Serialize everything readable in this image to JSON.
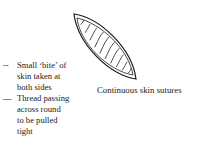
{
  "figure": {
    "caption": "Continuous skin sutures",
    "labels": [
      {
        "marker": "--",
        "lines": [
          "Small ‘bite’ of",
          "skin taken at",
          "both sides"
        ]
      },
      {
        "marker": "—",
        "lines": [
          "Thread passing",
          "across round",
          "to be pulled",
          "tight"
        ]
      }
    ],
    "colors": {
      "ink": "#1a1a1a",
      "background": "#ffffff"
    }
  }
}
